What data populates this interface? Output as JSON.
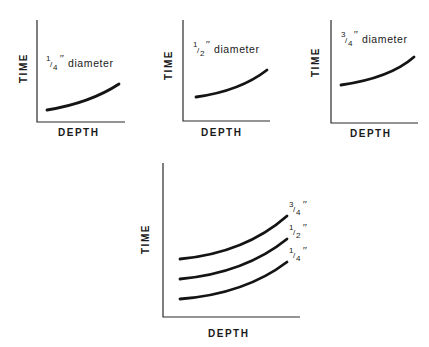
{
  "figure": {
    "panels": [
      {
        "id": "quarter",
        "title_fraction_num": "1",
        "title_fraction_den": "4",
        "title_suffix": "diameter",
        "x_label": "DEPTH",
        "y_label": "TIME"
      },
      {
        "id": "half",
        "title_fraction_num": "1",
        "title_fraction_den": "2",
        "title_suffix": "diameter",
        "x_label": "DEPTH",
        "y_label": "TIME"
      },
      {
        "id": "three-quarter",
        "title_fraction_num": "3",
        "title_fraction_den": "4",
        "title_suffix": "diameter",
        "x_label": "DEPTH",
        "y_label": "TIME"
      }
    ],
    "combined": {
      "x_label": "DEPTH",
      "y_label": "TIME",
      "curves": [
        {
          "label_num": "3",
          "label_den": "4"
        },
        {
          "label_num": "1",
          "label_den": "2"
        },
        {
          "label_num": "1",
          "label_den": "4"
        }
      ]
    },
    "inch_mark": "″",
    "slash": "/"
  }
}
